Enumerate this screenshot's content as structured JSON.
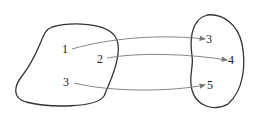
{
  "diagram": {
    "type": "mapping",
    "domain_set": {
      "elements": [
        "1",
        "2",
        "3"
      ]
    },
    "codomain_set": {
      "elements": [
        "3",
        "4",
        "5"
      ]
    },
    "mappings": [
      {
        "from": "1",
        "to": "3"
      },
      {
        "from": "2",
        "to": "4"
      },
      {
        "from": "3",
        "to": "5"
      }
    ],
    "colors": {
      "outline": "#333333",
      "arrow": "#777777"
    }
  }
}
